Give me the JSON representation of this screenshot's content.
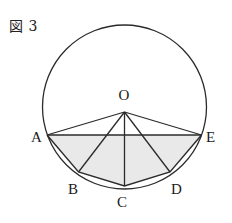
{
  "figure": {
    "caption": "図 3",
    "colors": {
      "stroke": "#2b2b2b",
      "shade_fill": "#e9e9e9",
      "background": "#ffffff",
      "label_color": "#1a1a1a"
    },
    "circle": {
      "center_label": "O",
      "cx": 124.5,
      "cy": 107,
      "r": 82
    },
    "vertices": [
      {
        "id": "O",
        "label": "O",
        "x": 124.5,
        "y": 112,
        "label_x": 118.5,
        "label_y": 100,
        "is_center": true
      },
      {
        "id": "A",
        "label": "A",
        "x": 47,
        "y": 135,
        "label_x": 31,
        "label_y": 142,
        "is_center": false
      },
      {
        "id": "B",
        "label": "B",
        "x": 78.5,
        "y": 172,
        "label_x": 68,
        "label_y": 194,
        "is_center": false
      },
      {
        "id": "C",
        "label": "C",
        "x": 124.5,
        "y": 186,
        "label_x": 117,
        "label_y": 207,
        "is_center": false
      },
      {
        "id": "D",
        "label": "D",
        "x": 170,
        "y": 172,
        "label_x": 171,
        "label_y": 194,
        "is_center": false
      },
      {
        "id": "E",
        "label": "E",
        "x": 201.5,
        "y": 135,
        "label_x": 206,
        "label_y": 142,
        "is_center": false
      }
    ],
    "shaded_region_path": "M 47 135 L 201.5 135 L 170 172 L 124.5 186 L 78.5 172 Z",
    "chords": [
      {
        "name": "chord-AE",
        "from": "A",
        "to": "E"
      },
      {
        "name": "chord-AB",
        "from": "A",
        "to": "B"
      },
      {
        "name": "chord-BC",
        "from": "B",
        "to": "C"
      },
      {
        "name": "chord-CD",
        "from": "C",
        "to": "D"
      },
      {
        "name": "chord-DE",
        "from": "D",
        "to": "E"
      }
    ],
    "radii": [
      {
        "name": "radius-OA",
        "to": "A"
      },
      {
        "name": "radius-OB",
        "to": "B"
      },
      {
        "name": "radius-OC",
        "to": "C"
      },
      {
        "name": "radius-OD",
        "to": "D"
      },
      {
        "name": "radius-OE",
        "to": "E"
      }
    ]
  }
}
